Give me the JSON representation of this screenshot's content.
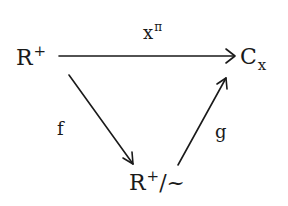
{
  "diagram": {
    "type": "commutative-diagram",
    "nodes": [
      {
        "id": "R_plus",
        "base": "R",
        "sup": "+",
        "suffix": ""
      },
      {
        "id": "C_x",
        "base": "C",
        "sub": "x"
      },
      {
        "id": "R_plus_quot",
        "base": "R",
        "sup": "+",
        "suffix": "/~"
      }
    ],
    "edges": [
      {
        "from": "R_plus",
        "to": "C_x",
        "label_base": "x",
        "label_sup": "π"
      },
      {
        "from": "R_plus",
        "to": "R_plus_quot",
        "label": "f"
      },
      {
        "from": "R_plus_quot",
        "to": "C_x",
        "label": "g"
      }
    ],
    "stroke_color": "#1a1a1a"
  }
}
